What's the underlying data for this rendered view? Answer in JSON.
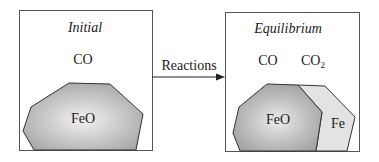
{
  "initial": {
    "title": "Initial",
    "gas": "CO",
    "solid": "FeO"
  },
  "arrow": {
    "label": "Reactions"
  },
  "equilibrium": {
    "title": "Equilibrium",
    "gas1": "CO",
    "gas2_main": "CO",
    "gas2_sub": "2",
    "solid1": "FeO",
    "solid2": "Fe"
  },
  "colors": {
    "border": "#444444",
    "feo_fill": "#b4b4b4",
    "feo_center": "#f0f0f0",
    "fe_fill": "#e2e2e2"
  }
}
